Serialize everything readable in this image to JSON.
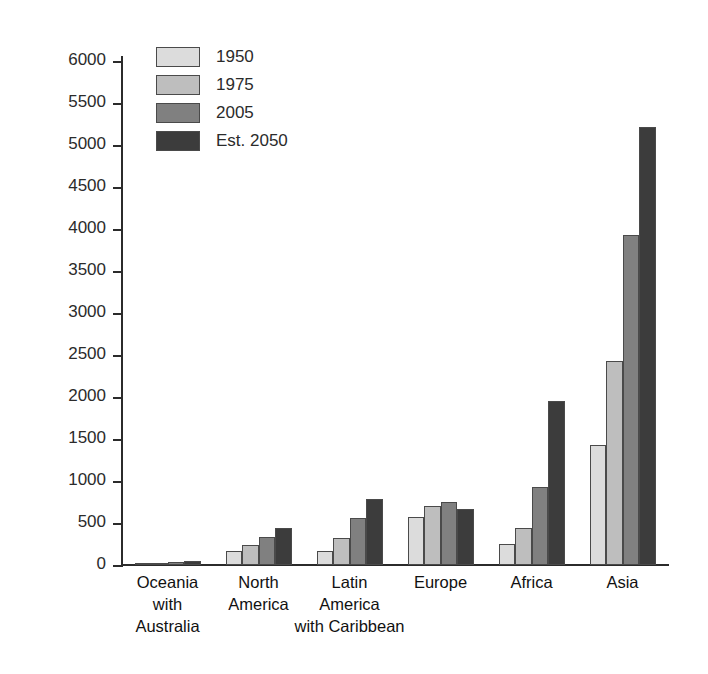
{
  "chart_data": {
    "type": "bar",
    "title": "",
    "xlabel": "",
    "ylabel": "Population (millions)",
    "ylim": [
      0,
      6000
    ],
    "ytick_step": 500,
    "yticks": [
      6000,
      5500,
      5000,
      4500,
      4000,
      3500,
      3000,
      2500,
      2000,
      1500,
      1000,
      500,
      0
    ],
    "ytick_labels": [
      "6000",
      "5500",
      "5000",
      "4500",
      "4000",
      "3500",
      "3000",
      "2500",
      "2000",
      "1500",
      "1000",
      "500",
      "0"
    ],
    "grid": false,
    "legend_position": "top-left",
    "categories": [
      "Oceania\nwith\nAustralia",
      "North\nAmerica",
      "Latin\nAmerica\nwith Caribbean",
      "Europe",
      "Africa",
      "Asia"
    ],
    "category_lines": [
      [
        "Oceania",
        "with",
        "Australia"
      ],
      [
        "North",
        "America"
      ],
      [
        "Latin",
        "America",
        "with Caribbean"
      ],
      [
        "Europe"
      ],
      [
        "Africa"
      ],
      [
        "Asia"
      ]
    ],
    "series": [
      {
        "name": "1950",
        "color": "#dcdcdc",
        "values": [
          13,
          172,
          168,
          575,
          250,
          1430
        ]
      },
      {
        "name": "1975",
        "color": "#bebebe",
        "values": [
          21,
          243,
          322,
          700,
          440,
          2430
        ]
      },
      {
        "name": "2005",
        "color": "#808080",
        "values": [
          33,
          332,
          560,
          750,
          930,
          3930
        ]
      },
      {
        "name": "Est. 2050",
        "color": "#3c3c3c",
        "values": [
          48,
          445,
          785,
          665,
          1950,
          5220
        ]
      }
    ]
  },
  "legend": {
    "entries": [
      "1950",
      "1975",
      "2005",
      "Est. 2050"
    ]
  },
  "axis": {
    "y_title": "Population (millions)"
  },
  "colors": {
    "series_1950": "#dcdcdc",
    "series_1975": "#bebebe",
    "series_2005": "#808080",
    "series_2050": "#3c3c3c",
    "axis": "#2b2b2b",
    "background": "#ffffff"
  }
}
